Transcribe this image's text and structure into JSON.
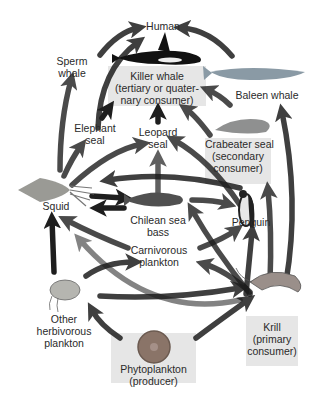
{
  "diagram": {
    "type": "food-web",
    "nodes": {
      "human": {
        "label": "Human"
      },
      "sperm_whale": {
        "line1": "Sperm",
        "line2": "whale"
      },
      "killer_whale": {
        "line1": "Killer whale",
        "line2": "(tertiary or quater-",
        "line3": "nary consumer)"
      },
      "baleen_whale": {
        "label": "Baleen whale"
      },
      "elephant_seal": {
        "line1": "Elephant",
        "line2": "seal"
      },
      "leopard_seal": {
        "line1": "Leopard",
        "line2": "seal"
      },
      "crabeater_seal": {
        "line1": "Crabeater seal",
        "line2": "(secondary",
        "line3": "consumer)"
      },
      "squid": {
        "label": "Squid"
      },
      "chilean_sea_bass": {
        "line1": "Chilean sea",
        "line2": "bass"
      },
      "penguin": {
        "label": "Penguin"
      },
      "carnivorous_plankton": {
        "line1": "Carnivorous",
        "line2": "plankton"
      },
      "other_herbivorous_plankton": {
        "line1": "Other",
        "line2": "herbivorous",
        "line3": "plankton"
      },
      "krill": {
        "line1": "Krill",
        "line2": "(primary",
        "line3": "consumer)"
      },
      "phytoplankton": {
        "line1": "Phytoplankton",
        "line2": "(producer)"
      }
    },
    "edges": [
      [
        "sperm_whale",
        "human"
      ],
      [
        "killer_whale",
        "human"
      ],
      [
        "baleen_whale",
        "human"
      ],
      [
        "squid",
        "sperm_whale"
      ],
      [
        "elephant_seal",
        "killer_whale"
      ],
      [
        "leopard_seal",
        "killer_whale"
      ],
      [
        "crabeater_seal",
        "killer_whale"
      ],
      [
        "baleen_whale",
        "killer_whale"
      ],
      [
        "krill",
        "baleen_whale"
      ],
      [
        "squid",
        "elephant_seal"
      ],
      [
        "squid",
        "leopard_seal"
      ],
      [
        "penguin",
        "leopard_seal"
      ],
      [
        "penguin",
        "squid"
      ],
      [
        "krill",
        "crabeater_seal"
      ],
      [
        "chilean_sea_bass",
        "leopard_seal"
      ],
      [
        "chilean_sea_bass",
        "penguin"
      ],
      [
        "squid",
        "chilean_sea_bass"
      ],
      [
        "chilean_sea_bass",
        "squid"
      ],
      [
        "krill",
        "chilean_sea_bass"
      ],
      [
        "krill",
        "penguin"
      ],
      [
        "carnivorous_plankton",
        "penguin"
      ],
      [
        "carnivorous_plankton",
        "squid"
      ],
      [
        "other_herbivorous_plankton",
        "squid"
      ],
      [
        "other_herbivorous_plankton",
        "carnivorous_plankton"
      ],
      [
        "krill",
        "carnivorous_plankton"
      ],
      [
        "other_herbivorous_plankton",
        "krill"
      ],
      [
        "phytoplankton",
        "krill"
      ],
      [
        "phytoplankton",
        "other_herbivorous_plankton"
      ],
      [
        "krill",
        "squid"
      ]
    ],
    "colors": {
      "arrow": "#1e1e1e",
      "label_box": "#e6e6e6",
      "text": "#2a2a2a"
    }
  }
}
